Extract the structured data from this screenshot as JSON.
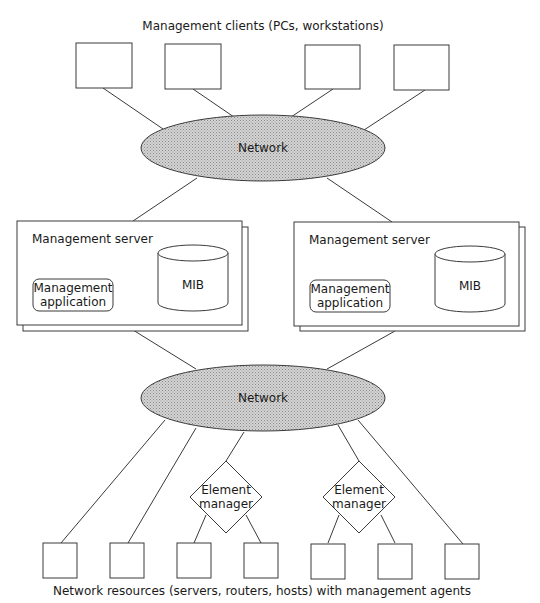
{
  "diagram": {
    "top_caption": "Management clients (PCs, workstations)",
    "bottom_caption": "Network resources (servers, routers, hosts) with management agents",
    "networks": [
      {
        "label": "Network",
        "cx": 263,
        "cy": 148
      },
      {
        "label": "Network",
        "cx": 263,
        "cy": 398
      }
    ],
    "clients": [
      {
        "x": 76,
        "y": 43,
        "w": 56,
        "h": 45
      },
      {
        "x": 165,
        "y": 44,
        "w": 56,
        "h": 45
      },
      {
        "x": 305,
        "y": 45,
        "w": 55,
        "h": 44
      },
      {
        "x": 394,
        "y": 45,
        "w": 55,
        "h": 45
      }
    ],
    "servers": [
      {
        "title": "Management server",
        "app_label_line1": "Management",
        "app_label_line2": "application",
        "db_label": "MIB",
        "x": 17,
        "y": 221
      },
      {
        "title": "Management server",
        "app_label_line1": "Management",
        "app_label_line2": "application",
        "db_label": "MIB",
        "x": 294,
        "y": 222
      }
    ],
    "element_managers": [
      {
        "label_line1": "Element",
        "label_line2": "manager",
        "cx": 226,
        "cy": 497
      },
      {
        "label_line1": "Element",
        "label_line2": "manager",
        "cx": 359,
        "cy": 497
      }
    ],
    "resources": [
      {
        "x": 43
      },
      {
        "x": 110
      },
      {
        "x": 177
      },
      {
        "x": 244
      },
      {
        "x": 311
      },
      {
        "x": 378
      },
      {
        "x": 445
      }
    ],
    "colors": {
      "stroke": "#3a3a3a",
      "network_fill": "#c8c8c8",
      "background": "#ffffff"
    }
  }
}
